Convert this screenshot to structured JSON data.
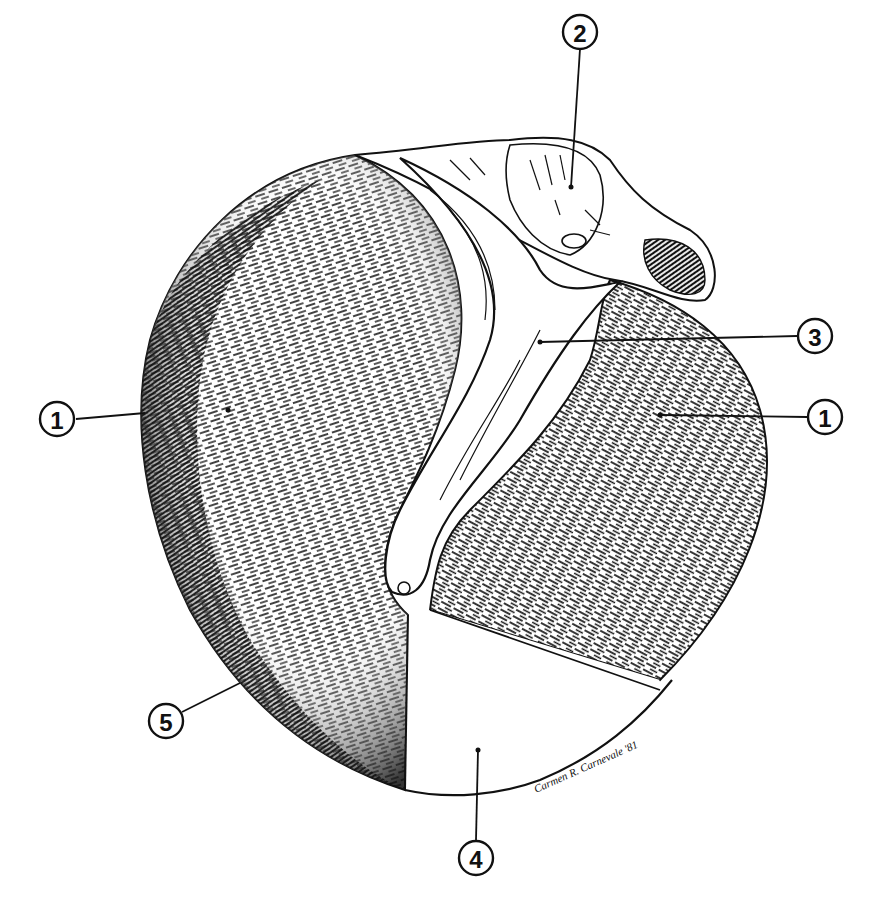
{
  "figure": {
    "type": "anatomical pen-and-ink illustration",
    "colors": {
      "ink": "#111111",
      "paper": "#ffffff"
    },
    "callouts": [
      {
        "id": "1a",
        "label": "1",
        "side": "left",
        "circle": [
          57,
          419
        ],
        "target": [
          228,
          410
        ]
      },
      {
        "id": "2",
        "label": "2",
        "side": "top",
        "circle": [
          580,
          32
        ],
        "target": [
          571,
          187
        ]
      },
      {
        "id": "3",
        "label": "3",
        "side": "right",
        "circle": [
          815,
          336
        ],
        "target": [
          540,
          342
        ]
      },
      {
        "id": "1b",
        "label": "1",
        "side": "right",
        "circle": [
          825,
          417
        ],
        "target": [
          660,
          415
        ]
      },
      {
        "id": "5",
        "label": "5",
        "side": "left",
        "circle": [
          166,
          721
        ],
        "target": [
          240,
          683
        ]
      },
      {
        "id": "4",
        "label": "4",
        "side": "bottom",
        "circle": [
          476,
          858
        ],
        "target": [
          478,
          750
        ]
      }
    ],
    "signature": "Carmen R. Carnevale '81"
  }
}
